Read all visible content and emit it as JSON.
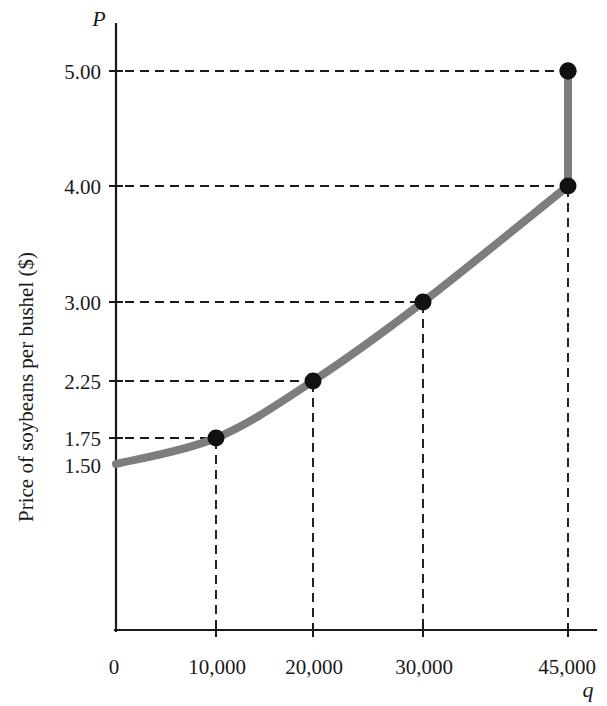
{
  "chart_data": {
    "type": "line",
    "title": "",
    "subtitle": "",
    "xlabel": "q",
    "ylabel": "Price of soybeans per bushel ($)",
    "y_axis_symbol": "P",
    "x_axis_symbol": "q",
    "xlim": [
      0,
      50000
    ],
    "ylim": [
      0,
      5.6
    ],
    "grid": false,
    "legend": null,
    "x_tick_labels": [
      "0",
      "10,000",
      "20,000",
      "30,000",
      "45,000"
    ],
    "x_tick_values": [
      0,
      10000,
      20000,
      30000,
      45000
    ],
    "y_tick_labels": [
      "5.00",
      "4.00",
      "3.00",
      "2.25",
      "1.75",
      "1.50"
    ],
    "y_tick_values": [
      5.0,
      4.0,
      3.0,
      2.25,
      1.75,
      1.5
    ],
    "series": [
      {
        "name": "Supply",
        "color": "#7d7d7d",
        "line_width": 8,
        "marker": "filled-circle",
        "marker_color": "#111111",
        "x": [
          0,
          10000,
          20000,
          30000,
          45000,
          45000
        ],
        "y": [
          1.5,
          1.75,
          2.25,
          3.0,
          4.0,
          5.0
        ]
      }
    ],
    "annotations": {
      "vertical_segment": "Supply becomes perfectly inelastic at q = 45,000, rising from $4.00 to $5.00",
      "dashed_guides": "Dashed leader lines connect each data point to its price on the vertical axis and its quantity on the horizontal axis"
    },
    "points": [
      {
        "label": "A",
        "q": 0,
        "q_label": "0",
        "p": 1.5,
        "p_label": "1.50"
      },
      {
        "label": "B",
        "q": 10000,
        "q_label": "10,000",
        "p": 1.75,
        "p_label": "1.75"
      },
      {
        "label": "C",
        "q": 20000,
        "q_label": "20,000",
        "p": 2.25,
        "p_label": "2.25"
      },
      {
        "label": "D",
        "q": 30000,
        "q_label": "30,000",
        "p": 3.0,
        "p_label": "3.00"
      },
      {
        "label": "E",
        "q": 45000,
        "q_label": "45,000",
        "p": 4.0,
        "p_label": "4.00"
      },
      {
        "label": "F",
        "q": 45000,
        "q_label": "45,000",
        "p": 5.0,
        "p_label": "5.00"
      }
    ]
  },
  "axes": {
    "y_title": "Price of soybeans per bushel ($)",
    "y_symbol": "P",
    "x_symbol": "q",
    "y_labels": {
      "t5": "5.00",
      "t4": "4.00",
      "t3": "3.00",
      "t225": "2.25",
      "t175": "1.75",
      "t150": "1.50"
    },
    "x_labels": {
      "t0": "0",
      "t10k": "10,000",
      "t20k": "20,000",
      "t30k": "30,000",
      "t45k": "45,000"
    }
  },
  "colors": {
    "curve": "#7d7d7d",
    "marker": "#111111",
    "axis": "#1a1a1a",
    "background": "#ffffff"
  }
}
